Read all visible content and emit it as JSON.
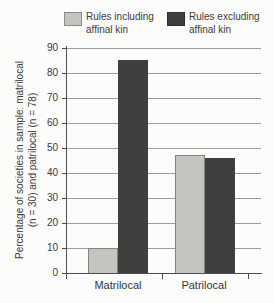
{
  "legend": {
    "items": [
      {
        "label": "Rules including\naffinal kin",
        "color": "#c4c4c0"
      },
      {
        "label": "Rules excluding\naffinal kin",
        "color": "#403f3d"
      }
    ]
  },
  "chart_data": {
    "type": "bar",
    "categories": [
      "Matrilocal",
      "Patrilocal"
    ],
    "series": [
      {
        "name": "Rules including affinal kin",
        "values": [
          10,
          47
        ],
        "color": "#c4c4c0"
      },
      {
        "name": "Rules excluding affinal kin",
        "values": [
          85,
          46
        ],
        "color": "#403f3d"
      }
    ],
    "ylabel_line1": "Percentage of societies in sample: matrilocal",
    "ylabel_line2": "(n = 30) and patrilocal (n = 78)",
    "xlabel": "",
    "ylim": [
      0,
      90
    ],
    "yticks": [
      0,
      10,
      20,
      30,
      40,
      50,
      60,
      70,
      80,
      90
    ],
    "grid": true,
    "legend_position": "top"
  },
  "colors": {
    "background": "#fcfcfb",
    "light_bar": "#c4c4c0",
    "dark_bar": "#403f3d",
    "gridline": "#9b9b9b",
    "axis": "#4d4d4d",
    "text": "#3a3a3a"
  }
}
